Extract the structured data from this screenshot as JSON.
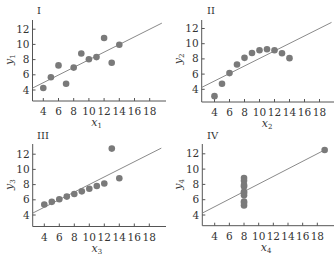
{
  "chart_data": [
    {
      "type": "scatter",
      "title": "I",
      "xlabel": "x1",
      "ylabel": "y1",
      "x": [
        10,
        8,
        13,
        9,
        11,
        14,
        6,
        4,
        12,
        7,
        5
      ],
      "y": [
        8.04,
        6.95,
        7.58,
        8.81,
        8.33,
        9.96,
        7.24,
        4.26,
        10.84,
        4.82,
        5.68
      ],
      "fit_line": {
        "intercept": 3,
        "slope": 0.5,
        "x_range": [
          2.5,
          19.6
        ]
      },
      "xticks": [
        4,
        6,
        8,
        10,
        12,
        14,
        16,
        18
      ],
      "yticks": [
        4,
        6,
        8,
        10,
        12
      ],
      "xlim": [
        2.5,
        19.6
      ],
      "ylim": [
        2.6,
        13.3
      ],
      "grid": false
    },
    {
      "type": "scatter",
      "title": "II",
      "xlabel": "x2",
      "ylabel": "y2",
      "x": [
        10,
        8,
        13,
        9,
        11,
        14,
        6,
        4,
        12,
        7,
        5
      ],
      "y": [
        9.14,
        8.14,
        8.74,
        8.77,
        9.26,
        8.1,
        6.13,
        3.1,
        9.13,
        7.26,
        4.74
      ],
      "fit_line": {
        "intercept": 3,
        "slope": 0.5,
        "x_range": [
          2.5,
          19.6
        ]
      },
      "xticks": [
        4,
        6,
        8,
        10,
        12,
        14,
        16,
        18
      ],
      "yticks": [
        4,
        6,
        8,
        10,
        12
      ],
      "xlim": [
        2.5,
        19.6
      ],
      "ylim": [
        2.6,
        13.3
      ],
      "grid": false
    },
    {
      "type": "scatter",
      "title": "III",
      "xlabel": "x3",
      "ylabel": "y3",
      "x": [
        10,
        8,
        13,
        9,
        11,
        14,
        6,
        4,
        12,
        7,
        5
      ],
      "y": [
        7.46,
        6.77,
        12.74,
        7.11,
        7.81,
        8.84,
        6.08,
        5.39,
        8.15,
        6.42,
        5.73
      ],
      "fit_line": {
        "intercept": 3,
        "slope": 0.5,
        "x_range": [
          2.5,
          19.6
        ]
      },
      "xticks": [
        4,
        6,
        8,
        10,
        12,
        14,
        16,
        18
      ],
      "yticks": [
        4,
        6,
        8,
        10,
        12
      ],
      "xlim": [
        2.5,
        19.6
      ],
      "ylim": [
        2.6,
        13.3
      ],
      "grid": false
    },
    {
      "type": "scatter",
      "title": "IV",
      "xlabel": "x4",
      "ylabel": "y4",
      "x": [
        8,
        8,
        8,
        8,
        8,
        8,
        8,
        19,
        8,
        8,
        8
      ],
      "y": [
        6.58,
        5.76,
        7.71,
        8.84,
        8.47,
        7.04,
        5.25,
        12.5,
        5.56,
        7.91,
        6.89
      ],
      "fit_line": {
        "intercept": 3,
        "slope": 0.5,
        "x_range": [
          2.5,
          19.2
        ]
      },
      "xticks": [
        4,
        6,
        8,
        10,
        12,
        14,
        16,
        18
      ],
      "yticks": [
        4,
        6,
        8,
        10,
        12
      ],
      "xlim": [
        2.5,
        19.5
      ],
      "ylim": [
        2.6,
        13.3
      ],
      "grid": false
    }
  ],
  "panels": [
    {
      "title": "I",
      "xlabel_var": "x",
      "xlabel_sub": "1",
      "ylabel_var": "y",
      "ylabel_sub": "1"
    },
    {
      "title": "II",
      "xlabel_var": "x",
      "xlabel_sub": "2",
      "ylabel_var": "y",
      "ylabel_sub": "2"
    },
    {
      "title": "III",
      "xlabel_var": "x",
      "xlabel_sub": "3",
      "ylabel_var": "y",
      "ylabel_sub": "3"
    },
    {
      "title": "IV",
      "xlabel_var": "x",
      "xlabel_sub": "4",
      "ylabel_var": "y",
      "ylabel_sub": "4"
    }
  ],
  "colors": {
    "points": "#7a7a7a",
    "fit_line": "#8a8a8a",
    "axis": "#555555",
    "text": "#333333"
  }
}
